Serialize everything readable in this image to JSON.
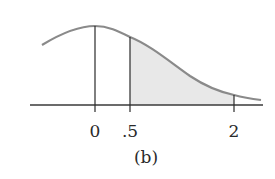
{
  "figure": {
    "caption": "(b)",
    "distribution": "normal",
    "peak_at": "0",
    "shaded_region": {
      "from": ".5",
      "to": "2"
    },
    "tick_labels": [
      "0",
      ".5",
      "2"
    ]
  },
  "colors": {
    "curve": "#8a8a8a",
    "axis": "#3a3a3a",
    "shade": "#e6e6e6"
  }
}
